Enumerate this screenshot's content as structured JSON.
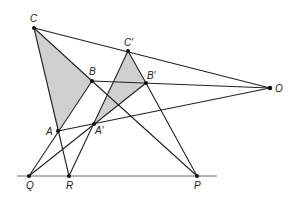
{
  "diagram": {
    "colors": {
      "line": "#222222",
      "fill": "#c8c8c8",
      "background": "#ffffff"
    },
    "points": {
      "C": {
        "label": "C",
        "x": 34,
        "y": 28
      },
      "B": {
        "label": "B",
        "x": 92,
        "y": 81
      },
      "A": {
        "label": "A",
        "x": 58,
        "y": 131
      },
      "C'": {
        "label": "C′",
        "x": 128,
        "y": 51
      },
      "B'": {
        "label": "B′",
        "x": 146,
        "y": 83
      },
      "A'": {
        "label": "A′",
        "x": 94,
        "y": 124
      },
      "O": {
        "label": "O",
        "x": 270,
        "y": 88
      },
      "Q": {
        "label": "Q",
        "x": 29,
        "y": 176
      },
      "R": {
        "label": "R",
        "x": 69,
        "y": 176
      },
      "P": {
        "label": "P",
        "x": 197,
        "y": 176
      }
    },
    "labels": {
      "C": "C",
      "B": "B",
      "A": "A",
      "Cp": "C′",
      "Bp": "B′",
      "Ap": "A′",
      "O": "O",
      "Q": "Q",
      "R": "R",
      "P": "P"
    }
  }
}
